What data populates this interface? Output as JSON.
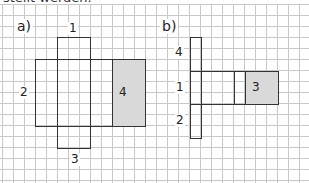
{
  "header_fragment": "stellt werden.",
  "part_a": {
    "label": "a)",
    "faces": {
      "top": "1",
      "left": "2",
      "bottom": "3",
      "right_gray": "4"
    }
  },
  "part_b": {
    "label": "b)",
    "faces": {
      "upper": "4",
      "middle": "1",
      "lower": "2",
      "right_gray": "3"
    }
  },
  "colors": {
    "outline": "#333333",
    "shaded": "#d9d9d9",
    "grid": "#c8c8c8"
  }
}
